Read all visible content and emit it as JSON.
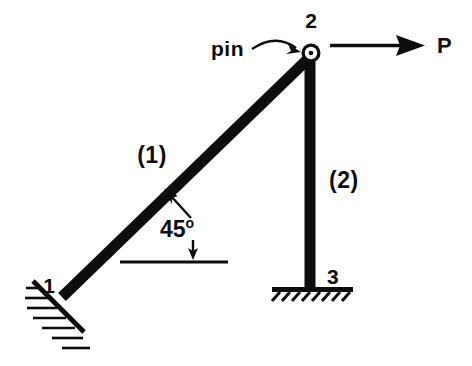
{
  "figure": {
    "background_color": "#ffffff",
    "ink_color": "#0d0d0d",
    "width": 472,
    "height": 366,
    "nodes": [
      {
        "id": "1",
        "label": "1",
        "x": 62,
        "y": 297,
        "support": "inclined-hatched-support"
      },
      {
        "id": "2",
        "label": "2",
        "x": 311,
        "y": 53,
        "support": "pin"
      },
      {
        "id": "3",
        "label": "3",
        "x": 310,
        "y": 288,
        "support": "fixed-ground"
      }
    ],
    "members": [
      {
        "id": "1",
        "label": "(1)",
        "from": "1",
        "to": "2",
        "orientation": "diagonal",
        "angle_deg": 45
      },
      {
        "id": "2",
        "label": "(2)",
        "from": "2",
        "to": "3",
        "orientation": "vertical"
      }
    ],
    "annotations": {
      "pin_label": "pin",
      "angle_value": "45",
      "angle_unit": "o",
      "force_label": "P",
      "force_direction": "horizontal-right"
    }
  }
}
